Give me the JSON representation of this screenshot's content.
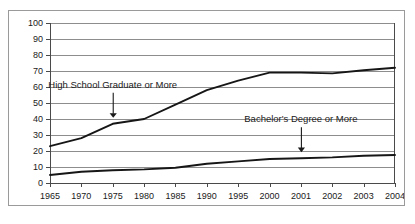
{
  "chart_data": {
    "type": "line",
    "title": "",
    "xlabel": "",
    "ylabel": "",
    "ylim": [
      0,
      100
    ],
    "ytick_step": 10,
    "grid": true,
    "legend": "none",
    "categories": [
      "1965",
      "1970",
      "1975",
      "1980",
      "1985",
      "1990",
      "1995",
      "2000",
      "2001",
      "2002",
      "2003",
      "2004"
    ],
    "ytick_labels": [
      "100",
      "90",
      "80",
      "70",
      "60",
      "50",
      "40",
      "30",
      "20",
      "10",
      "0"
    ],
    "ytick_values": [
      100,
      90,
      80,
      70,
      60,
      50,
      40,
      30,
      20,
      10,
      0
    ],
    "series": [
      {
        "name": "High School Graduate or More",
        "values": [
          23,
          28,
          37,
          40,
          49,
          58,
          64,
          69,
          69,
          68.5,
          70.5,
          72
        ]
      },
      {
        "name": "Bachelor's Degree or More",
        "values": [
          5,
          7,
          8,
          8.5,
          9.5,
          12,
          13.5,
          15,
          15.5,
          16,
          17,
          17.5
        ]
      }
    ],
    "annotations": [
      {
        "text": "High School Graduate or More",
        "label_x_category": "1975",
        "points_to_series": "High School Graduate or More",
        "arrow": "down-arrow"
      },
      {
        "text": "Bachelor's Degree or More",
        "label_x_category": "2001",
        "points_to_series": "Bachelor's Degree or More",
        "arrow": "down-arrow"
      }
    ],
    "colors": {
      "line": "#161616",
      "gridline": "#8d8d8d",
      "axis": "#4a4a4a",
      "background": "#ffffff",
      "text": "#1a1a1a",
      "frame": "#9a9a9a"
    }
  }
}
